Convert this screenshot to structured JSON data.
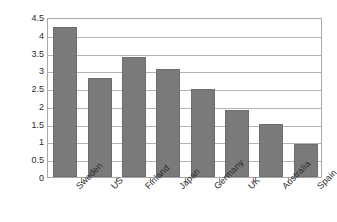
{
  "chart_data": {
    "type": "bar",
    "title": "",
    "xlabel": "",
    "ylabel": "Percentage",
    "categories": [
      "Sweden",
      "US",
      "Finland",
      "Japan",
      "Germany",
      "UK",
      "Australia",
      "Spain"
    ],
    "values": [
      4.23,
      2.78,
      3.38,
      3.05,
      2.47,
      1.88,
      1.5,
      0.93
    ],
    "ylim": [
      0,
      4.5
    ],
    "ytick_labels": [
      "0",
      "0.5",
      "1",
      "1.5",
      "2",
      "2.5",
      "3",
      "3.5",
      "4",
      "4.5"
    ],
    "ytick_values": [
      0,
      0.5,
      1,
      1.5,
      2,
      2.5,
      3,
      3.5,
      4,
      4.5
    ],
    "grid": true,
    "legend": "none",
    "bar_color": "#7a7a7a",
    "plot_border_color": "#a8a8a8",
    "gridline_color": "#b4b4b4",
    "background_color": "#ffffff",
    "annotations": [
      {
        "name": "bar-marker-dot",
        "series_index": 0,
        "approx_value": 2.3
      }
    ]
  }
}
